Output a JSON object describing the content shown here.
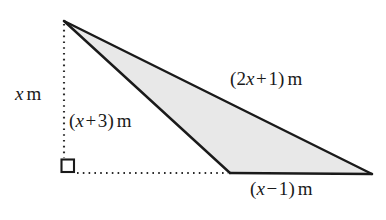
{
  "figure": {
    "type": "geometry-diagram",
    "units": "m",
    "colors": {
      "stroke": "#1a1a1a",
      "shade_fill": "#e8e8e8",
      "background": "#ffffff",
      "dotted_stroke": "#2b2b2b"
    },
    "labels": {
      "height": {
        "var": "x",
        "unit": "m",
        "full": "x m"
      },
      "left_side": {
        "open_paren": "(",
        "var": "x",
        "operator": "+",
        "number": "3",
        "close_paren": ")",
        "unit": "m",
        "full": "(x + 3) m"
      },
      "long_side": {
        "open_paren": "(",
        "coefficient": "2",
        "var": "x",
        "operator": "+",
        "number": "1",
        "close_paren": ")",
        "unit": "m",
        "full": "(2x + 1) m"
      },
      "base": {
        "open_paren": "(",
        "var": "x",
        "operator": "−",
        "number": "1",
        "close_paren": ")",
        "unit": "m",
        "full": "(x − 1) m"
      }
    },
    "markers": {
      "right_angle": "right-angle-square"
    }
  }
}
